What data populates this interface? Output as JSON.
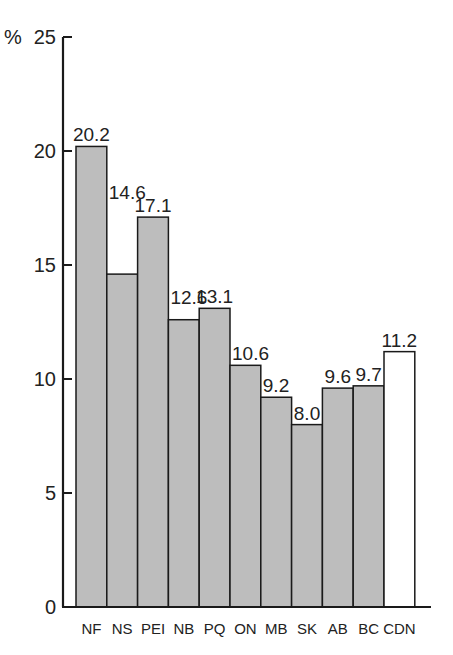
{
  "chart_data": {
    "type": "bar",
    "title": "",
    "xlabel": "",
    "ylabel": "%",
    "ylim": [
      0,
      25
    ],
    "yticks": [
      0,
      5,
      10,
      15,
      20,
      25
    ],
    "grid": false,
    "legend": null,
    "categories": [
      "NF",
      "NS",
      "PEI",
      "NB",
      "PQ",
      "ON",
      "MB",
      "SK",
      "AB",
      "BC",
      "CDN"
    ],
    "values": [
      20.2,
      14.6,
      17.1,
      12.6,
      13.1,
      10.6,
      9.2,
      8.0,
      9.6,
      9.7,
      11.2
    ],
    "value_labels": [
      "20.2",
      "14.6",
      "17.1",
      "12.6",
      "13.1",
      "10.6",
      "9.2",
      "8.0",
      "9.6",
      "9.7",
      "11.2"
    ],
    "bar_colors": [
      "#bdbdbd",
      "#bdbdbd",
      "#bdbdbd",
      "#bdbdbd",
      "#bdbdbd",
      "#bdbdbd",
      "#bdbdbd",
      "#bdbdbd",
      "#bdbdbd",
      "#bdbdbd",
      "#ffffff"
    ],
    "highlight": {
      "category": "CDN",
      "note": "national total shown as white bar"
    }
  },
  "colors": {
    "province_bar": "#bdbdbd",
    "national_bar": "#ffffff",
    "axis": "#1a1a1a"
  }
}
